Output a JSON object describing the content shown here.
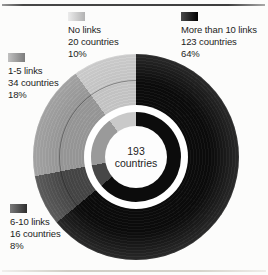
{
  "page": {
    "background": "#fcfcfb",
    "rules": {
      "top_color": "#3e3e3e",
      "bottom_color": "#d2cfc7"
    }
  },
  "chart_data": {
    "type": "pie",
    "variant": "donut_with_concentric_inner_ring",
    "title": "",
    "direction": "clockwise",
    "start_angle_deg": 0,
    "total": 193,
    "center_label": {
      "value": "193",
      "unit": "countries"
    },
    "slices": [
      {
        "label": "More than 10 links",
        "countries": 123,
        "percent": 64,
        "countries_label": "123 countries",
        "percent_label": "64%",
        "color": "#0c0c0c",
        "swatch_from": "#4a4a4a",
        "swatch_to": "#000000"
      },
      {
        "label": "6-10 links",
        "countries": 16,
        "percent": 8,
        "countries_label": "16 countries",
        "percent_label": "8%",
        "color": "#474747",
        "swatch_from": "#7a7a7a",
        "swatch_to": "#2e2e2e"
      },
      {
        "label": "1-5 links",
        "countries": 34,
        "percent": 18,
        "countries_label": "34 countries",
        "percent_label": "18%",
        "color": "#9a9a9a",
        "swatch_from": "#c1c1c1",
        "swatch_to": "#7c7c7c"
      },
      {
        "label": "No links",
        "countries": 20,
        "percent": 10,
        "countries_label": "20 countries",
        "percent_label": "10%",
        "color": "#c9c9c9",
        "swatch_from": "#ececec",
        "swatch_to": "#b2b2b2"
      }
    ],
    "legend_position": "corners-around-chart"
  }
}
